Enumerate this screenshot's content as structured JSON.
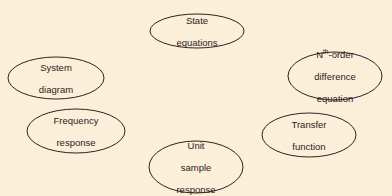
{
  "diagram": {
    "background": "#fbefd9",
    "stroke": "#2a2420",
    "nodes": [
      {
        "id": "state-equations",
        "lines": [
          "State",
          "equations"
        ],
        "cx": 197,
        "cy": 31,
        "rx": 47,
        "ry": 17
      },
      {
        "id": "system-diagram",
        "lines": [
          "System",
          "diagram"
        ],
        "cx": 56,
        "cy": 78,
        "rx": 48,
        "ry": 21
      },
      {
        "id": "nth-order-difference-equation",
        "sup_base": "N",
        "sup": "th",
        "first_suffix": "-order",
        "lines": [
          "difference",
          "equation"
        ],
        "cx": 335,
        "cy": 76,
        "rx": 47,
        "ry": 24
      },
      {
        "id": "frequency-response",
        "lines": [
          "Frequency",
          "response"
        ],
        "cx": 76,
        "cy": 131,
        "rx": 49,
        "ry": 22
      },
      {
        "id": "transfer-function",
        "lines": [
          "Transfer",
          "function"
        ],
        "cx": 309,
        "cy": 135,
        "rx": 47,
        "ry": 22
      },
      {
        "id": "unit-sample-response",
        "lines": [
          "Unit",
          "sample",
          "response"
        ],
        "cx": 196,
        "cy": 167,
        "rx": 47,
        "ry": 26
      }
    ]
  }
}
